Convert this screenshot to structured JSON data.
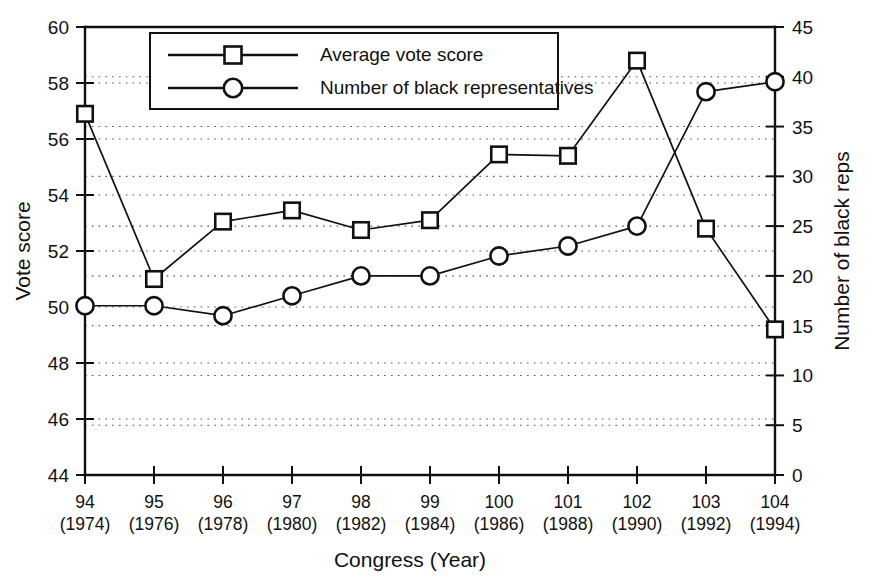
{
  "chart_data": {
    "type": "line",
    "title": "",
    "xlabel": "Congress (Year)",
    "ylabel": "Vote score",
    "y2label": "Number of black reps",
    "categories": [
      "94",
      "95",
      "96",
      "97",
      "98",
      "99",
      "100",
      "101",
      "102",
      "103",
      "104"
    ],
    "category_sublabels": [
      "(1974)",
      "(1976)",
      "(1978)",
      "(1980)",
      "(1982)",
      "(1984)",
      "(1986)",
      "(1988)",
      "(1990)",
      "(1992)",
      "(1994)"
    ],
    "ylim": [
      44,
      60
    ],
    "yticks": [
      44,
      46,
      48,
      50,
      52,
      54,
      56,
      58,
      60
    ],
    "y2lim": [
      0,
      45
    ],
    "y2ticks": [
      0,
      5,
      10,
      15,
      20,
      25,
      30,
      35,
      40,
      45
    ],
    "grid": true,
    "grid_style": "dotted-horizontal",
    "legend_position": "top-center-inside",
    "series": [
      {
        "name": "Average vote score",
        "marker": "square",
        "axis": "left",
        "values": [
          56.9,
          51.0,
          53.05,
          53.45,
          52.75,
          53.1,
          55.45,
          55.4,
          58.8,
          52.8,
          49.2
        ]
      },
      {
        "name": "Number of black representatives",
        "marker": "circle",
        "axis": "right",
        "values": [
          17,
          17,
          16,
          18,
          20,
          20,
          22,
          23,
          25,
          38.5,
          39.5
        ]
      }
    ]
  },
  "legend": {
    "items": [
      {
        "label": "Average vote score",
        "marker": "square"
      },
      {
        "label": "Number of black representatives",
        "marker": "circle"
      }
    ]
  },
  "axes": {
    "left_title": "Vote score",
    "right_title": "Number of black reps",
    "bottom_title": "Congress (Year)"
  },
  "colors": {
    "ink": "#111111",
    "background": "#ffffff",
    "grid": "#555555"
  }
}
